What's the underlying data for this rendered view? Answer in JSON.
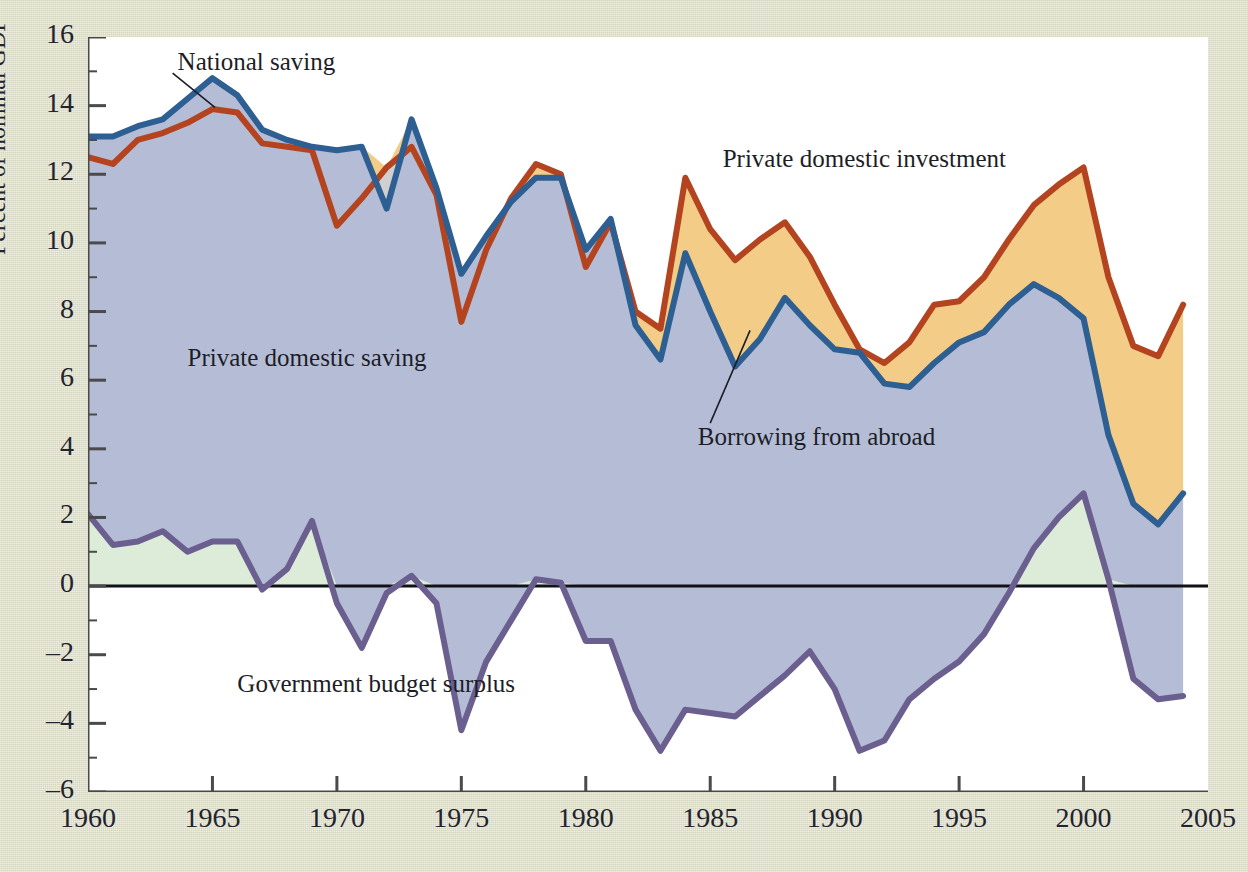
{
  "chart_data": {
    "type": "area",
    "title": "",
    "xlabel": "",
    "ylabel": "Percent of nominal GDP",
    "xlim": [
      1960,
      2005
    ],
    "ylim": [
      -6,
      16
    ],
    "xticks": [
      "1960",
      "1965",
      "1970",
      "1975",
      "1980",
      "1985",
      "1990",
      "1995",
      "2000",
      "2005"
    ],
    "yticks": [
      "16",
      "14",
      "12",
      "10",
      "8",
      "6",
      "4",
      "2",
      "0",
      "-2",
      "-4",
      "-6"
    ],
    "grid": false,
    "legend_position": "inline-annotations",
    "annotations": [
      {
        "text": "National saving",
        "x": 1963.6,
        "y": 15.2
      },
      {
        "text": "Private domestic investment",
        "x": 1985.5,
        "y": 12.4
      },
      {
        "text": "Private domestic saving",
        "x": 1964.0,
        "y": 6.6
      },
      {
        "text": "Borrowing from abroad",
        "x": 1984.5,
        "y": 4.3
      },
      {
        "text": "Government budget surplus",
        "x": 1966.0,
        "y": -2.9
      }
    ],
    "x": [
      1960,
      1961,
      1962,
      1963,
      1964,
      1965,
      1966,
      1967,
      1968,
      1969,
      1970,
      1971,
      1972,
      1973,
      1974,
      1975,
      1976,
      1977,
      1978,
      1979,
      1980,
      1981,
      1982,
      1983,
      1984,
      1985,
      1986,
      1987,
      1988,
      1989,
      1990,
      1991,
      1992,
      1993,
      1994,
      1995,
      1996,
      1997,
      1998,
      1999,
      2000,
      2001,
      2002,
      2003,
      2004
    ],
    "series": [
      {
        "name": "National saving",
        "color": "#2d5f93",
        "values": [
          13.1,
          13.1,
          13.4,
          13.6,
          14.2,
          14.8,
          14.3,
          13.3,
          13.0,
          12.8,
          12.7,
          12.8,
          11.0,
          13.6,
          11.6,
          9.1,
          10.2,
          11.2,
          11.9,
          11.9,
          9.8,
          10.7,
          7.6,
          6.6,
          9.7,
          8.0,
          6.4,
          7.2,
          8.4,
          7.6,
          6.9,
          6.8,
          5.9,
          5.8,
          6.5,
          7.1,
          7.4,
          8.2,
          8.8,
          8.4,
          7.8,
          4.4,
          2.4,
          1.8,
          2.7
        ]
      },
      {
        "name": "Private domestic investment",
        "color": "#b4441f",
        "values": [
          12.5,
          12.3,
          13.0,
          13.2,
          13.5,
          13.9,
          13.8,
          12.9,
          12.8,
          12.7,
          10.5,
          11.3,
          12.2,
          12.8,
          11.4,
          7.7,
          9.8,
          11.3,
          12.3,
          12.0,
          9.3,
          10.6,
          8.0,
          7.5,
          11.9,
          10.4,
          9.5,
          10.1,
          10.6,
          9.6,
          8.2,
          6.9,
          6.5,
          7.1,
          8.2,
          8.3,
          9.0,
          10.1,
          11.1,
          11.7,
          12.2,
          9.0,
          7.0,
          6.7,
          8.2
        ]
      },
      {
        "name": "Government budget surplus",
        "color": "#6b5f8f",
        "values": [
          2.1,
          1.2,
          1.3,
          1.6,
          1.0,
          1.3,
          1.3,
          -0.1,
          0.5,
          1.9,
          -0.5,
          -1.8,
          -0.2,
          0.3,
          -0.5,
          -4.2,
          -2.2,
          -1.0,
          0.2,
          0.1,
          -1.6,
          -1.6,
          -3.6,
          -4.8,
          -3.6,
          -3.7,
          -3.8,
          -3.2,
          -2.6,
          -1.9,
          -3.0,
          -4.8,
          -4.5,
          -3.3,
          -2.7,
          -2.2,
          -1.4,
          -0.2,
          1.1,
          2.0,
          2.7,
          0.2,
          -2.7,
          -3.3,
          -3.2
        ]
      }
    ],
    "fills": [
      {
        "name": "private-domestic-saving",
        "color": "#b5bdd6"
      },
      {
        "name": "borrowing-from-abroad",
        "color": "#f3cd87"
      },
      {
        "name": "national-saving-above-investment",
        "color": "#cfd0d1"
      },
      {
        "name": "government-surplus-positive",
        "color": "#dcecd8"
      }
    ]
  },
  "axis": {
    "ylabel": "Percent of nominal GDP"
  },
  "colors": {
    "background": "#dedfc9",
    "plot_background": "#ffffff",
    "national_saving_line": "#2d5f93",
    "investment_line": "#b4441f",
    "government_line": "#6b5f8f",
    "private_saving_fill": "#b5bdd6",
    "borrowing_fill": "#f3cd87",
    "green_fill": "#dcecd8",
    "zero_line": "#111118",
    "axis_line": "#4a4a4a"
  }
}
